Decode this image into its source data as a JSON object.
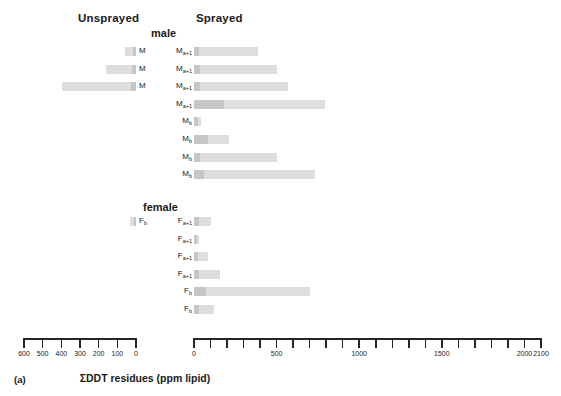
{
  "headers": {
    "unsprayed": "Unsprayed",
    "sprayed": "Sprayed"
  },
  "groups": {
    "male": "male",
    "female": "female"
  },
  "caption": {
    "panel": "(a)",
    "axis_title": "ΣDDT residues (ppm lipid)"
  },
  "axes": {
    "left": {
      "min": 0,
      "max": 600,
      "reversed": true,
      "labels": [
        "600",
        "500",
        "400",
        "300",
        "200",
        "100",
        "0"
      ],
      "tick_values": [
        600,
        500,
        400,
        300,
        200,
        100,
        0
      ],
      "px_zero": 136,
      "px_max": 24
    },
    "right": {
      "min": 0,
      "max": 2100,
      "reversed": false,
      "labels": [
        "0",
        "500",
        "1000",
        "1500",
        "2000",
        "2100"
      ],
      "labeled_values": [
        0,
        500,
        1000,
        1500,
        2000,
        2100
      ],
      "tick_step": 100,
      "px_zero": 194,
      "px_max": 541
    }
  },
  "chart_data": {
    "type": "bar",
    "orientation": "horizontal",
    "title": "ΣDDT residues (ppm lipid)",
    "xlabel": "ΣDDT residues (ppm lipid)",
    "ylabel": "",
    "grid": false,
    "legend": "none",
    "panels": [
      {
        "name": "Unsprayed",
        "direction": "left",
        "xlim": [
          0,
          600
        ],
        "series": [
          {
            "name": "leading",
            "color": "#c6c6c6"
          },
          {
            "name": "body",
            "color": "#dedede"
          }
        ],
        "groups": [
          {
            "name": "male",
            "bars": [
              {
                "label": "M",
                "subscript": "",
                "total": 60,
                "leading": 18,
                "body": 42
              },
              {
                "label": "M",
                "subscript": "",
                "total": 160,
                "leading": 22,
                "body": 138
              },
              {
                "label": "M",
                "subscript": "",
                "total": 395,
                "leading": 26,
                "body": 369
              }
            ]
          },
          {
            "name": "female",
            "bars": [
              {
                "label": "F",
                "subscript": "b",
                "total": 34,
                "leading": 12,
                "body": 22
              }
            ]
          }
        ]
      },
      {
        "name": "Sprayed",
        "direction": "right",
        "xlim": [
          0,
          2100
        ],
        "series": [
          {
            "name": "leading",
            "color": "#c6c6c6"
          },
          {
            "name": "body",
            "color": "#dedede"
          }
        ],
        "groups": [
          {
            "name": "male",
            "bars": [
              {
                "label": "M",
                "subscript": "a+1",
                "total": 390,
                "leading": 30,
                "body": 360
              },
              {
                "label": "M",
                "subscript": "a+1",
                "total": 500,
                "leading": 36,
                "body": 464
              },
              {
                "label": "M",
                "subscript": "a+1",
                "total": 570,
                "leading": 36,
                "body": 534
              },
              {
                "label": "M",
                "subscript": "a+1",
                "total": 790,
                "leading": 180,
                "body": 610
              },
              {
                "label": "M",
                "subscript": "b",
                "total": 45,
                "leading": 22,
                "body": 23
              },
              {
                "label": "M",
                "subscript": "b",
                "total": 210,
                "leading": 85,
                "body": 125
              },
              {
                "label": "M",
                "subscript": "b",
                "total": 500,
                "leading": 36,
                "body": 464
              },
              {
                "label": "M",
                "subscript": "b",
                "total": 735,
                "leading": 60,
                "body": 675
              }
            ]
          },
          {
            "name": "female",
            "bars": [
              {
                "label": "F",
                "subscript": "a+1",
                "total": 105,
                "leading": 30,
                "body": 75
              },
              {
                "label": "F",
                "subscript": "a+1",
                "total": 32,
                "leading": 16,
                "body": 16
              },
              {
                "label": "F",
                "subscript": "a+1",
                "total": 85,
                "leading": 26,
                "body": 59
              },
              {
                "label": "F",
                "subscript": "a+1",
                "total": 155,
                "leading": 30,
                "body": 125
              },
              {
                "label": "F",
                "subscript": "b",
                "total": 700,
                "leading": 70,
                "body": 630
              },
              {
                "label": "F",
                "subscript": "b",
                "total": 120,
                "leading": 30,
                "body": 90
              }
            ]
          }
        ]
      }
    ]
  }
}
